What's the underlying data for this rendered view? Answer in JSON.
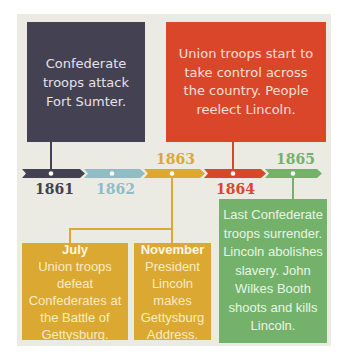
{
  "colors": {
    "background": "#ecebe3",
    "y1861": "#444152",
    "y1862": "#8fbdc6",
    "y1863": "#dba832",
    "y1864": "#d9462a",
    "y1865": "#74b26b"
  },
  "timeline": {
    "years": [
      {
        "label": "1861",
        "color": "#444152",
        "position": "below"
      },
      {
        "label": "1862",
        "color": "#8fbdc6",
        "position": "below"
      },
      {
        "label": "1863",
        "color": "#dba832",
        "position": "above"
      },
      {
        "label": "1864",
        "color": "#d9462a",
        "position": "below"
      },
      {
        "label": "1865",
        "color": "#74b26b",
        "position": "above"
      }
    ]
  },
  "events": {
    "e1861": {
      "year": "1861",
      "text": "Confederate troops attack Fort Sumter."
    },
    "e1864": {
      "year": "1864",
      "text": "Union troops start to take control across the country. People reelect Lincoln."
    },
    "e1863_july": {
      "year": "1863",
      "month": "July",
      "text": "Union troops defeat Confederates at the Battle of Gettysburg."
    },
    "e1863_nov": {
      "year": "1863",
      "month": "November",
      "text": "President Lincoln makes Gettysburg Address."
    },
    "e1865": {
      "year": "1865",
      "text": "Last Confederate troops surrender. Lincoln abolishes slavery. John Wilkes Booth shoots and kills Lincoln."
    }
  }
}
